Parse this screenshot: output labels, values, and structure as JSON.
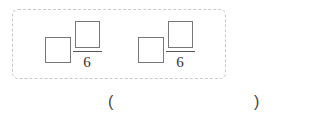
{
  "question": {
    "fractions": [
      {
        "whole": "",
        "numerator": "",
        "denominator": "6"
      },
      {
        "whole": "",
        "numerator": "",
        "denominator": "6"
      }
    ],
    "answer": {
      "open": "(",
      "value": "",
      "close": ")"
    }
  }
}
